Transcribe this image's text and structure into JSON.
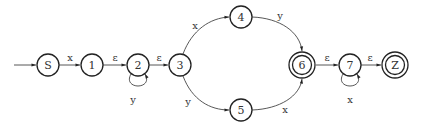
{
  "diagram": {
    "type": "finite-automaton",
    "nodes": [
      {
        "id": "S",
        "label": "S",
        "x": 48,
        "y": 65,
        "accepting": false,
        "start": true
      },
      {
        "id": "1",
        "label": "1",
        "x": 92,
        "y": 65,
        "accepting": false
      },
      {
        "id": "2",
        "label": "2",
        "x": 138,
        "y": 65,
        "accepting": false
      },
      {
        "id": "3",
        "label": "3",
        "x": 180,
        "y": 65,
        "accepting": false
      },
      {
        "id": "4",
        "label": "4",
        "x": 241,
        "y": 17,
        "accepting": false
      },
      {
        "id": "5",
        "label": "5",
        "x": 241,
        "y": 110,
        "accepting": false
      },
      {
        "id": "6",
        "label": "6",
        "x": 302,
        "y": 65,
        "accepting": true
      },
      {
        "id": "7",
        "label": "7",
        "x": 350,
        "y": 65,
        "accepting": false
      },
      {
        "id": "Z",
        "label": "Z",
        "x": 395,
        "y": 65,
        "accepting": true
      }
    ],
    "edges": [
      {
        "from": "S",
        "to": "1",
        "label": "x"
      },
      {
        "from": "1",
        "to": "2",
        "label": "ε"
      },
      {
        "from": "2",
        "to": "2",
        "label": "y"
      },
      {
        "from": "2",
        "to": "3",
        "label": "ε"
      },
      {
        "from": "3",
        "to": "4",
        "label": "x"
      },
      {
        "from": "3",
        "to": "5",
        "label": "y"
      },
      {
        "from": "4",
        "to": "6",
        "label": "y"
      },
      {
        "from": "5",
        "to": "6",
        "label": "x"
      },
      {
        "from": "6",
        "to": "7",
        "label": "ε"
      },
      {
        "from": "7",
        "to": "7",
        "label": "x"
      },
      {
        "from": "7",
        "to": "Z",
        "label": "ε"
      }
    ]
  }
}
